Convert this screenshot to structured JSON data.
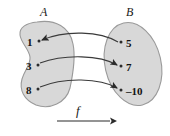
{
  "figure": {
    "type": "function-mapping-diagram",
    "title": "",
    "domain_set": {
      "name": "A",
      "label": "A",
      "shape": "kidney-bean",
      "elements": [
        {
          "value": "1",
          "dot": true
        },
        {
          "value": "3",
          "dot": true
        },
        {
          "value": "8",
          "dot": true
        }
      ]
    },
    "codomain_set": {
      "name": "B",
      "label": "B",
      "shape": "tilted-ellipse",
      "elements": [
        {
          "value": "5",
          "dot": true
        },
        {
          "value": "7",
          "dot": true
        },
        {
          "value": "–10",
          "dot": true
        }
      ]
    },
    "mapping": {
      "label": "f",
      "arrow_label": "f",
      "direction": "left-to-right",
      "pairs": [
        {
          "from": "1",
          "to": "5",
          "arrowhead_at": "from"
        },
        {
          "from": "3",
          "to": "7",
          "arrowhead_at": "to"
        },
        {
          "from": "8",
          "to": "–10",
          "arrowhead_at": "to"
        }
      ]
    },
    "colors": {
      "set_fill": "#d8d8d8",
      "set_stroke": "#9a9a9a",
      "curve_stroke": "#3a3a3a",
      "dot": "#2b2b2b",
      "text": "#121212",
      "background": "#ffffff"
    }
  }
}
